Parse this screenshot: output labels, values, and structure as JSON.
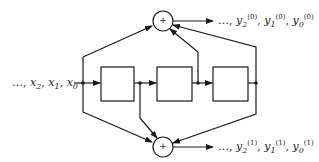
{
  "diagram": {
    "type": "convolutional-encoder",
    "input_label": {
      "prefix": "…,",
      "terms": [
        {
          "var": "x",
          "sub": "2"
        },
        {
          "var": "x",
          "sub": "1"
        },
        {
          "var": "x",
          "sub": "0"
        }
      ]
    },
    "adders": [
      {
        "id": "adder-top",
        "symbol": "+"
      },
      {
        "id": "adder-bottom",
        "symbol": "+"
      }
    ],
    "delay_boxes": 3,
    "outputs": [
      {
        "id": "output-0",
        "prefix": "…,",
        "terms": [
          {
            "var": "y",
            "sub": "2",
            "sup": "(0)"
          },
          {
            "var": "y",
            "sub": "1",
            "sup": "(0)"
          },
          {
            "var": "y",
            "sub": "0",
            "sup": "(0)"
          }
        ]
      },
      {
        "id": "output-1",
        "prefix": "…,",
        "terms": [
          {
            "var": "y",
            "sub": "2",
            "sup": "(1)"
          },
          {
            "var": "y",
            "sub": "1",
            "sup": "(1)"
          },
          {
            "var": "y",
            "sub": "0",
            "sup": "(1)"
          }
        ]
      }
    ],
    "colors": {
      "stroke": "#1a1a1a",
      "background": "#ffffff"
    }
  }
}
